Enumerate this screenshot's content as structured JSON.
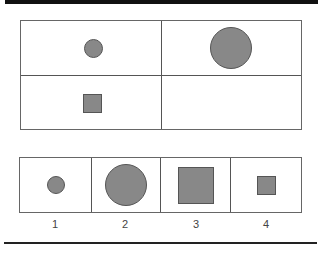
{
  "puzzle": {
    "type": "figure analogy",
    "matrix": [
      {
        "row": 1,
        "col": 1,
        "shape": "circle",
        "size": "small",
        "fill": "#888888"
      },
      {
        "row": 1,
        "col": 2,
        "shape": "circle",
        "size": "large",
        "fill": "#888888"
      },
      {
        "row": 2,
        "col": 1,
        "shape": "square",
        "size": "small",
        "fill": "#888888"
      },
      {
        "row": 2,
        "col": 2,
        "shape": "empty",
        "size": "",
        "fill": ""
      }
    ],
    "options": [
      {
        "label": "1",
        "shape": "circle",
        "size": "small"
      },
      {
        "label": "2",
        "shape": "circle",
        "size": "large"
      },
      {
        "label": "3",
        "shape": "square",
        "size": "large"
      },
      {
        "label": "4",
        "shape": "square",
        "size": "small"
      }
    ]
  },
  "colors": {
    "shape_fill": "#888888",
    "shape_border": "#555555",
    "rule": "#111111"
  }
}
